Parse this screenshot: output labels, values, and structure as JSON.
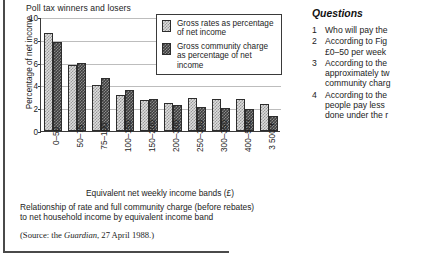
{
  "figure": {
    "title": "Poll tax winners and losers",
    "ylabel": "Percentage of net income",
    "xlabel": "Equivalent net weekly income bands (£)",
    "caption_line1": "Relationship of rate and full community charge (before rebates)",
    "caption_line2": "to net household income by equivalent income band",
    "source_prefix": "(Source: the ",
    "source_italic": "Guardian",
    "source_suffix": ", 27 April 1988.)",
    "legend": [
      {
        "swatch": "light-hatched-swatch",
        "label": "Gross rates as percentage of net income"
      },
      {
        "swatch": "dark-hatched-swatch",
        "label": "Gross community charge as percentage of net income"
      }
    ]
  },
  "chart_data": {
    "type": "bar",
    "title": "Poll tax winners and losers",
    "xlabel": "Equivalent net weekly income bands (£)",
    "ylabel": "Percentage of net income",
    "ylim": [
      0,
      10
    ],
    "yticks": [
      0,
      2,
      4,
      6,
      8,
      10
    ],
    "grid": true,
    "legend_position": "top-right-inset",
    "categories": [
      "0–50",
      "50–75",
      "75–100",
      "100–150",
      "150–200",
      "200–300",
      "250–300",
      "300–350",
      "400–500",
      "3 500 +"
    ],
    "series": [
      {
        "name": "Gross rates as percentage of net income",
        "values": [
          8.6,
          5.8,
          4.0,
          3.2,
          2.75,
          2.5,
          2.9,
          2.85,
          2.85,
          2.35
        ]
      },
      {
        "name": "Gross community charge as percentage of net income",
        "values": [
          7.8,
          6.0,
          4.65,
          3.6,
          2.85,
          2.25,
          2.1,
          2.0,
          1.95,
          1.3
        ]
      }
    ]
  },
  "questions": {
    "heading": "Questions",
    "items": [
      {
        "number": "1",
        "lines": [
          "Who will pay the"
        ]
      },
      {
        "number": "2",
        "lines": [
          "According to Fig",
          "£0–50 per week"
        ]
      },
      {
        "number": "3",
        "lines": [
          "According to the",
          "approximately tw",
          "community charg"
        ]
      },
      {
        "number": "4",
        "lines": [
          "According to the",
          "people pay less",
          "done under the r"
        ]
      }
    ]
  }
}
